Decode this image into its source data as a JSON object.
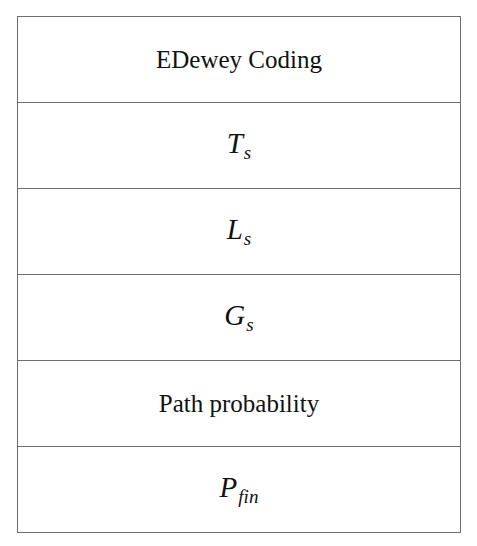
{
  "diagram": {
    "type": "stacked-blocks",
    "blocks": [
      {
        "kind": "text",
        "label": "EDewey Coding"
      },
      {
        "kind": "math",
        "base": "T",
        "sub": "s"
      },
      {
        "kind": "math",
        "base": "L",
        "sub": "s"
      },
      {
        "kind": "math",
        "base": "G",
        "sub": "s"
      },
      {
        "kind": "text",
        "label": "Path probability"
      },
      {
        "kind": "math",
        "base": "P",
        "sub": "fin"
      }
    ]
  }
}
